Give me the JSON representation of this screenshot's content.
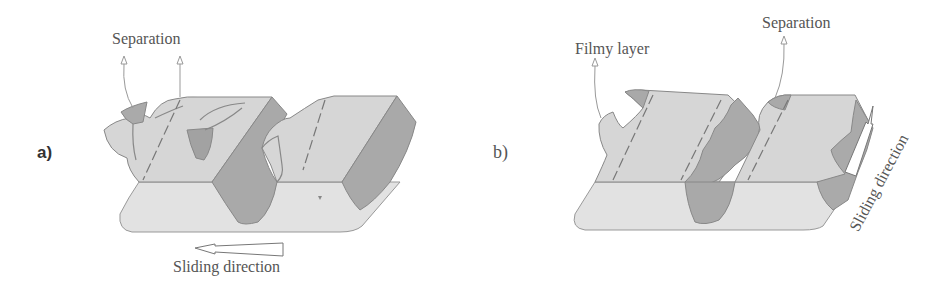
{
  "figure": {
    "panels": [
      {
        "id": "a",
        "letter": "a)",
        "labels": {
          "separation": "Separation",
          "sliding_direction": "Sliding direction"
        }
      },
      {
        "id": "b",
        "letter": "b)",
        "labels": {
          "filmy_layer": "Filmy layer",
          "separation": "Separation",
          "sliding_direction": "Sliding direction"
        }
      }
    ],
    "colors": {
      "surface_light": "#d6d6d6",
      "base_lighter": "#e2e2e2",
      "worn_dark": "#a9a9a9",
      "outline": "#8a8a8a",
      "text": "#555555"
    }
  }
}
